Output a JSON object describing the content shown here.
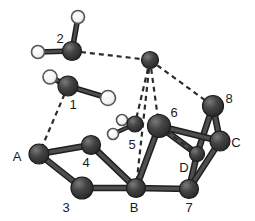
{
  "figure": {
    "type": "molecular-cluster-diagram",
    "background_color": "#ffffff",
    "atom_color_dark": "#3a3a3a",
    "atom_color_light": "#ffffff",
    "bond_color": "#3a3a3a",
    "hbond_color": "#2b2b2b",
    "label_color": "#1a1a1a",
    "labels": [
      {
        "text": "2",
        "x": 60,
        "y": 38
      },
      {
        "text": "1",
        "x": 73,
        "y": 104
      },
      {
        "text": "8",
        "x": 229,
        "y": 98
      },
      {
        "text": "6",
        "x": 174,
        "y": 112
      },
      {
        "text": "5",
        "x": 132,
        "y": 144
      },
      {
        "text": "C",
        "x": 236,
        "y": 142
      },
      {
        "text": "A",
        "x": 17,
        "y": 156
      },
      {
        "text": "4",
        "x": 86,
        "y": 162
      },
      {
        "text": "D",
        "x": 184,
        "y": 167
      },
      {
        "text": "3",
        "x": 66,
        "y": 207
      },
      {
        "text": "B",
        "x": 134,
        "y": 207
      },
      {
        "text": "7",
        "x": 189,
        "y": 207
      }
    ],
    "atoms": [
      {
        "id": "w2-h-top",
        "name": "water-2-hydrogen-top",
        "x": 78,
        "y": 17,
        "r": 6.5,
        "kind": "light"
      },
      {
        "id": "w2-o",
        "name": "water-2-oxygen",
        "x": 72,
        "y": 51,
        "r": 9.5,
        "kind": "dark"
      },
      {
        "id": "w2-h-left",
        "name": "water-2-hydrogen-left",
        "x": 38,
        "y": 52,
        "r": 6.5,
        "kind": "light"
      },
      {
        "id": "hub",
        "name": "bridging-atom-hub",
        "x": 150,
        "y": 60,
        "r": 8.5,
        "kind": "dark"
      },
      {
        "id": "w1-h-left",
        "name": "water-1-hydrogen-left",
        "x": 50,
        "y": 77,
        "r": 7.0,
        "kind": "light"
      },
      {
        "id": "w1-o",
        "name": "water-1-oxygen",
        "x": 68,
        "y": 86,
        "r": 10.0,
        "kind": "dark"
      },
      {
        "id": "w1-h-right",
        "name": "water-1-hydrogen-right",
        "x": 108,
        "y": 98,
        "r": 7.5,
        "kind": "light"
      },
      {
        "id": "a8",
        "name": "atom-8",
        "x": 213,
        "y": 106,
        "r": 10.5,
        "kind": "dark"
      },
      {
        "id": "w5-h-up",
        "name": "water-5-hydrogen-upper",
        "x": 122,
        "y": 120,
        "r": 5.5,
        "kind": "light"
      },
      {
        "id": "w5-o",
        "name": "water-5-oxygen",
        "x": 135,
        "y": 124,
        "r": 8.0,
        "kind": "dark"
      },
      {
        "id": "w5-h-low",
        "name": "water-5-hydrogen-lower",
        "x": 113,
        "y": 134,
        "r": 5.5,
        "kind": "light"
      },
      {
        "id": "a6",
        "name": "atom-6",
        "x": 159,
        "y": 126,
        "r": 11.5,
        "kind": "dark"
      },
      {
        "id": "aC",
        "name": "atom-C",
        "x": 220,
        "y": 141,
        "r": 10.0,
        "kind": "dark"
      },
      {
        "id": "a4",
        "name": "atom-4",
        "x": 91,
        "y": 145,
        "r": 9.5,
        "kind": "dark"
      },
      {
        "id": "aA",
        "name": "atom-A",
        "x": 39,
        "y": 154,
        "r": 10.0,
        "kind": "dark"
      },
      {
        "id": "aD",
        "name": "atom-D",
        "x": 197,
        "y": 154,
        "r": 7.5,
        "kind": "dark"
      },
      {
        "id": "a3",
        "name": "atom-3",
        "x": 82,
        "y": 188,
        "r": 11.0,
        "kind": "dark"
      },
      {
        "id": "aB",
        "name": "atom-B",
        "x": 136,
        "y": 188,
        "r": 9.5,
        "kind": "dark"
      },
      {
        "id": "a7",
        "name": "atom-7",
        "x": 189,
        "y": 189,
        "r": 9.5,
        "kind": "dark"
      }
    ],
    "bonds": [
      {
        "name": "bond-water2-h-top",
        "from": "w2-o",
        "to": "w2-h-top",
        "style": "solid",
        "width": 4
      },
      {
        "name": "bond-water2-h-left",
        "from": "w2-o",
        "to": "w2-h-left",
        "style": "solid",
        "width": 4
      },
      {
        "name": "bond-water1-h-left",
        "from": "w1-o",
        "to": "w1-h-left",
        "style": "solid",
        "width": 4
      },
      {
        "name": "bond-water1-h-right",
        "from": "w1-o",
        "to": "w1-h-right",
        "style": "solid",
        "width": 4
      },
      {
        "name": "bond-water5-h-up",
        "from": "w5-o",
        "to": "w5-h-up",
        "style": "solid",
        "width": 3
      },
      {
        "name": "bond-water5-h-low",
        "from": "w5-o",
        "to": "w5-h-low",
        "style": "solid",
        "width": 3
      },
      {
        "name": "bond-A-4",
        "from": "aA",
        "to": "a4",
        "style": "solid",
        "width": 5
      },
      {
        "name": "bond-A-3",
        "from": "aA",
        "to": "a3",
        "style": "solid",
        "width": 5
      },
      {
        "name": "bond-4-B",
        "from": "a4",
        "to": "aB",
        "style": "solid",
        "width": 5
      },
      {
        "name": "bond-3-B",
        "from": "a3",
        "to": "aB",
        "style": "solid",
        "width": 5
      },
      {
        "name": "bond-B-6",
        "from": "aB",
        "to": "a6",
        "style": "solid",
        "width": 5
      },
      {
        "name": "bond-B-7",
        "from": "aB",
        "to": "a7",
        "style": "solid",
        "width": 5
      },
      {
        "name": "bond-6-D",
        "from": "a6",
        "to": "aD",
        "style": "solid",
        "width": 5
      },
      {
        "name": "bond-7-D",
        "from": "a7",
        "to": "aD",
        "style": "solid",
        "width": 5
      },
      {
        "name": "bond-7-C",
        "from": "a7",
        "to": "aC",
        "style": "solid",
        "width": 5
      },
      {
        "name": "bond-8-C",
        "from": "a8",
        "to": "aC",
        "style": "solid",
        "width": 5
      },
      {
        "name": "bond-8-D",
        "from": "a8",
        "to": "aD",
        "style": "solid",
        "width": 5
      },
      {
        "name": "bond-6-C",
        "from": "a6",
        "to": "aC",
        "style": "solid",
        "width": 5
      }
    ],
    "hydrogen_bonds": [
      {
        "name": "hbond-water2-hub",
        "from": "w2-o",
        "to": "hub",
        "style": "dashed"
      },
      {
        "name": "hbond-hub-8",
        "from": "hub",
        "to": "a8",
        "style": "dashed"
      },
      {
        "name": "hbond-hub-water5",
        "from": "hub",
        "to": "w5-o",
        "style": "dashed"
      },
      {
        "name": "hbond-hub-6",
        "from": "hub",
        "to": "a6",
        "style": "dashed"
      },
      {
        "name": "hbond-hub-B",
        "from": "hub",
        "to": "aB",
        "style": "dashed"
      },
      {
        "name": "hbond-water1-A",
        "from": "w1-o",
        "to": "aA",
        "style": "dashed"
      },
      {
        "name": "hbond-6-D",
        "from": "a6",
        "to": "aD",
        "style": "dashed"
      }
    ]
  }
}
